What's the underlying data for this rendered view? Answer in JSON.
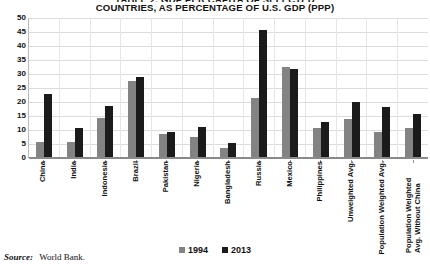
{
  "figure": {
    "title_clipped_line": "TABLE 2. GDP PER CAPITA OF SELECTED",
    "title": "COUNTRIES, AS PERCENTAGE OF U.S. GDP (PPP)",
    "source_label": "Source:",
    "source_value": "World Bank."
  },
  "legend": {
    "position": "bottom-center",
    "items": [
      {
        "label": "1994",
        "color": "#838383"
      },
      {
        "label": "2013",
        "color": "#1b1b1b"
      }
    ]
  },
  "chart_data": {
    "type": "bar",
    "title": "COUNTRIES, AS PERCENTAGE OF U.S. GDP (PPP)",
    "xlabel": "",
    "ylabel": "",
    "ylim": [
      0,
      50
    ],
    "yticks": [
      0,
      5,
      10,
      15,
      20,
      25,
      30,
      35,
      40,
      45,
      50
    ],
    "grid": true,
    "legend": [
      "1994",
      "2013"
    ],
    "categories": [
      "China",
      "India",
      "Indonesia",
      "Brazil",
      "Pakistan",
      "Nigeria",
      "Bangladesh",
      "Russia",
      "Mexico",
      "Philippines",
      "Unweighted Avg.",
      "Population Weighted Avg.",
      "Population Weighted Avg. Without China"
    ],
    "series": [
      {
        "name": "1994",
        "color": "#838383",
        "values": [
          5.5,
          5.2,
          14.0,
          27.0,
          8.3,
          7.3,
          3.2,
          21.0,
          32.0,
          10.2,
          13.6,
          9.0,
          10.5
        ]
      },
      {
        "name": "2013",
        "color": "#1b1b1b",
        "values": [
          22.6,
          10.2,
          18.1,
          28.5,
          9.0,
          10.6,
          5.0,
          45.5,
          31.5,
          12.5,
          19.6,
          18.0,
          15.2
        ]
      }
    ]
  }
}
